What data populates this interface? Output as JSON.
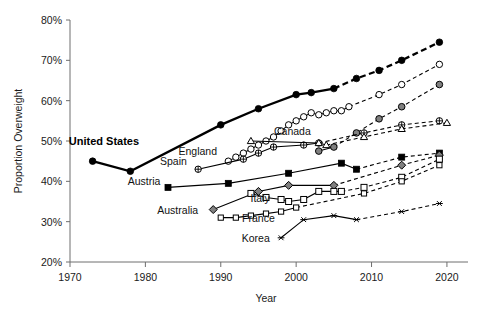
{
  "chart_data": {
    "type": "line",
    "title": "",
    "xlabel": "Year",
    "ylabel": "Proportion Overweight",
    "xlim": [
      1970,
      2022
    ],
    "ylim": [
      20,
      80
    ],
    "xticks": [
      1970,
      1980,
      1990,
      2000,
      2010,
      2020
    ],
    "xtick_labels": [
      "1970",
      "1980",
      "1990",
      "2000",
      "2010",
      "2020"
    ],
    "yticks": [
      20,
      30,
      40,
      50,
      60,
      70,
      80
    ],
    "ytick_labels": [
      "20%",
      "30%",
      "40%",
      "50%",
      "60%",
      "70%",
      "80%"
    ],
    "grid": false,
    "legend": "inline-labels",
    "note": "solid segments are observed data, dashed segments are projections",
    "series": [
      {
        "name": "United States",
        "marker": "filled-circle",
        "line": "thick-solid",
        "label_x": 1974.5,
        "label_y": 49.0,
        "label_anchor": "middle",
        "observed": [
          {
            "x": 1973,
            "y": 45.0
          },
          {
            "x": 1978,
            "y": 42.5
          },
          {
            "x": 1990,
            "y": 54.0
          },
          {
            "x": 1995,
            "y": 58.0
          },
          {
            "x": 2000,
            "y": 61.5
          },
          {
            "x": 2002,
            "y": 62.0
          },
          {
            "x": 2005,
            "y": 63.0
          }
        ],
        "projected": [
          {
            "x": 2005,
            "y": 63.0
          },
          {
            "x": 2008,
            "y": 65.5
          },
          {
            "x": 2011,
            "y": 67.5
          },
          {
            "x": 2014,
            "y": 70.0
          },
          {
            "x": 2019,
            "y": 74.5
          }
        ]
      },
      {
        "name": "England",
        "marker": "open-circle",
        "line": "thin",
        "label_x": 1989.5,
        "label_y": 46.5,
        "label_anchor": "end",
        "observed": [
          {
            "x": 1991,
            "y": 45.0
          },
          {
            "x": 1992,
            "y": 46.0
          },
          {
            "x": 1993,
            "y": 47.0
          },
          {
            "x": 1994,
            "y": 48.0
          },
          {
            "x": 1995,
            "y": 49.0
          },
          {
            "x": 1996,
            "y": 50.0
          },
          {
            "x": 1997,
            "y": 51.0
          },
          {
            "x": 1998,
            "y": 52.5
          },
          {
            "x": 1999,
            "y": 54.0
          },
          {
            "x": 2000,
            "y": 55.0
          },
          {
            "x": 2001,
            "y": 56.0
          },
          {
            "x": 2002,
            "y": 57.0
          },
          {
            "x": 2003,
            "y": 56.5
          },
          {
            "x": 2004,
            "y": 57.0
          },
          {
            "x": 2005,
            "y": 57.5
          },
          {
            "x": 2006,
            "y": 57.5
          },
          {
            "x": 2007,
            "y": 58.5
          }
        ],
        "projected": [
          {
            "x": 2007,
            "y": 58.5
          },
          {
            "x": 2011,
            "y": 61.5
          },
          {
            "x": 2014,
            "y": 64.0
          },
          {
            "x": 2019,
            "y": 69.0
          }
        ]
      },
      {
        "name": "Canada",
        "marker": "gray-circle",
        "line": "thin",
        "label_x": 1999.5,
        "label_y": 51.5,
        "label_anchor": "middle",
        "observed": [
          {
            "x": 2003,
            "y": 47.5
          },
          {
            "x": 2005,
            "y": 48.5
          }
        ],
        "projected": [
          {
            "x": 2005,
            "y": 48.5
          },
          {
            "x": 2008,
            "y": 52.0
          },
          {
            "x": 2011,
            "y": 55.5
          },
          {
            "x": 2014,
            "y": 58.5
          },
          {
            "x": 2019,
            "y": 64.0
          }
        ]
      },
      {
        "name": "Spain",
        "marker": "crossed-circle",
        "line": "thin",
        "label_x": 1985.5,
        "label_y": 44.0,
        "label_anchor": "end",
        "observed": [
          {
            "x": 1987,
            "y": 43.0
          },
          {
            "x": 1993,
            "y": 45.5
          },
          {
            "x": 1995,
            "y": 47.0
          },
          {
            "x": 1997,
            "y": 48.5
          },
          {
            "x": 2001,
            "y": 49.0
          },
          {
            "x": 2003,
            "y": 49.5
          }
        ],
        "projected": [
          {
            "x": 2003,
            "y": 49.5
          },
          {
            "x": 2009,
            "y": 52.0
          },
          {
            "x": 2014,
            "y": 54.0
          },
          {
            "x": 2019,
            "y": 55.0
          }
        ]
      },
      {
        "name": "Canada-alt-triangle",
        "marker": "open-triangle",
        "line": "thin",
        "label_x": null,
        "label_y": null,
        "label_anchor": "middle",
        "observed": [
          {
            "x": 1994,
            "y": 50.0
          },
          {
            "x": 2003,
            "y": 49.5
          },
          {
            "x": 2004,
            "y": 49.0
          }
        ],
        "projected": [
          {
            "x": 2004,
            "y": 49.0
          },
          {
            "x": 2009,
            "y": 51.0
          },
          {
            "x": 2014,
            "y": 53.0
          },
          {
            "x": 2020,
            "y": 54.5
          }
        ]
      },
      {
        "name": "Austria",
        "marker": "filled-square",
        "line": "thin",
        "label_x": 1982.0,
        "label_y": 39.0,
        "label_anchor": "end",
        "observed": [
          {
            "x": 1983,
            "y": 38.5
          },
          {
            "x": 1991,
            "y": 39.5
          },
          {
            "x": 1999,
            "y": 42.0
          },
          {
            "x": 2006,
            "y": 44.5
          },
          {
            "x": 2008,
            "y": 43.0
          }
        ],
        "projected": [
          {
            "x": 2008,
            "y": 43.0
          },
          {
            "x": 2014,
            "y": 46.0
          },
          {
            "x": 2019,
            "y": 47.0
          }
        ]
      },
      {
        "name": "Australia",
        "marker": "gray-diamond",
        "line": "thin",
        "label_x": 1987.0,
        "label_y": 32.0,
        "label_anchor": "end",
        "observed": [
          {
            "x": 1989,
            "y": 33.0
          },
          {
            "x": 1995,
            "y": 37.5
          },
          {
            "x": 1999,
            "y": 39.0
          },
          {
            "x": 2005,
            "y": 39.0
          }
        ],
        "projected": [
          {
            "x": 2005,
            "y": 39.0
          },
          {
            "x": 2014,
            "y": 44.0
          },
          {
            "x": 2019,
            "y": 46.5
          }
        ]
      },
      {
        "name": "Italy",
        "marker": "open-square",
        "line": "thin",
        "label_x": 1996.5,
        "label_y": 35.0,
        "label_anchor": "end",
        "observed": [
          {
            "x": 1994,
            "y": 37.0
          },
          {
            "x": 1996,
            "y": 36.0
          },
          {
            "x": 1998,
            "y": 35.5
          },
          {
            "x": 1999,
            "y": 35.0
          },
          {
            "x": 2001,
            "y": 35.5
          },
          {
            "x": 2003,
            "y": 37.5
          },
          {
            "x": 2005,
            "y": 37.5
          },
          {
            "x": 2006,
            "y": 37.5
          }
        ],
        "projected": [
          {
            "x": 2006,
            "y": 37.5
          },
          {
            "x": 2009,
            "y": 38.5
          },
          {
            "x": 2014,
            "y": 41.0
          },
          {
            "x": 2019,
            "y": 45.5
          }
        ]
      },
      {
        "name": "France",
        "marker": "open-square-small",
        "line": "thin",
        "label_x": 1995.0,
        "label_y": 30.0,
        "label_anchor": "middle",
        "observed": [
          {
            "x": 1990,
            "y": 31.0
          },
          {
            "x": 1992,
            "y": 31.0
          },
          {
            "x": 1994,
            "y": 31.5
          },
          {
            "x": 1996,
            "y": 32.0
          },
          {
            "x": 1998,
            "y": 32.5
          },
          {
            "x": 2000,
            "y": 33.5
          }
        ],
        "projected": [
          {
            "x": 2000,
            "y": 33.5
          },
          {
            "x": 2009,
            "y": 37.0
          },
          {
            "x": 2014,
            "y": 40.0
          },
          {
            "x": 2019,
            "y": 44.0
          }
        ]
      },
      {
        "name": "Korea",
        "marker": "asterisk",
        "line": "thin",
        "label_x": 1996.5,
        "label_y": 25.0,
        "label_anchor": "end",
        "observed": [
          {
            "x": 1998,
            "y": 26.0
          },
          {
            "x": 2001,
            "y": 30.5
          },
          {
            "x": 2005,
            "y": 31.5
          },
          {
            "x": 2008,
            "y": 30.5
          }
        ],
        "projected": [
          {
            "x": 2008,
            "y": 30.5
          },
          {
            "x": 2014,
            "y": 32.5
          },
          {
            "x": 2019,
            "y": 34.5
          }
        ]
      }
    ]
  },
  "colors": {
    "ink": "#000000",
    "axis": "#6e6e6e",
    "gray_fill": "#808080",
    "white_fill": "#ffffff"
  }
}
